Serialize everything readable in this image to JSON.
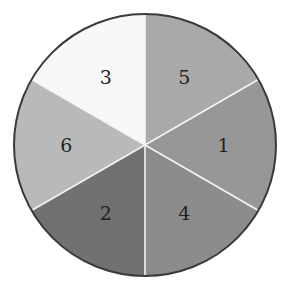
{
  "diagram": {
    "type": "divided-circle",
    "center": [
      145,
      145
    ],
    "radius": 131,
    "outline_color": "#3a3a3a",
    "divider_color": "#f4f4f4",
    "wedges": [
      {
        "label": "5",
        "start_deg": 0,
        "end_deg": 60,
        "color": "#a9a9a9"
      },
      {
        "label": "1",
        "start_deg": 60,
        "end_deg": 120,
        "color": "#979797"
      },
      {
        "label": "4",
        "start_deg": 120,
        "end_deg": 180,
        "color": "#8c8c8c"
      },
      {
        "label": "2",
        "start_deg": 180,
        "end_deg": 240,
        "color": "#717171"
      },
      {
        "label": "6",
        "start_deg": 240,
        "end_deg": 300,
        "color": "#b9b9b9"
      },
      {
        "label": "3",
        "start_deg": 300,
        "end_deg": 360,
        "color": "#f8f8f8"
      }
    ]
  }
}
